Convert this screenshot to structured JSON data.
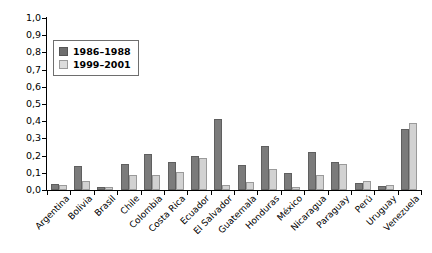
{
  "chart_data": {
    "type": "bar",
    "title": "",
    "xlabel": "",
    "ylabel": "",
    "ylim": [
      0,
      1.0
    ],
    "grid": false,
    "legend_position": "top-left",
    "ytick_labels": [
      "1,0",
      "0,9",
      "0,8",
      "0,7",
      "0,6",
      "0,5",
      "0,4",
      "0,3",
      "0,2",
      "0,1",
      "0,0"
    ],
    "ytick_values": [
      1.0,
      0.9,
      0.8,
      0.7,
      0.6,
      0.5,
      0.4,
      0.3,
      0.2,
      0.1,
      0.0
    ],
    "categories": [
      "Argentina",
      "Bolivia",
      "Brasil",
      "Chile",
      "Colombia",
      "Costa Rica",
      "Ecuador",
      "El Salvador",
      "Guatemala",
      "Honduras",
      "México",
      "Nicaragua",
      "Paraguay",
      "Perú",
      "Uruguay",
      "Venezuela"
    ],
    "series": [
      {
        "name": "1986–1988",
        "color": "#7b7b7b",
        "values": [
          0.035,
          0.14,
          0.015,
          0.15,
          0.208,
          0.16,
          0.195,
          0.41,
          0.145,
          0.255,
          0.1,
          0.222,
          0.16,
          0.04,
          0.025,
          0.355
        ]
      },
      {
        "name": "1999–2001",
        "color": "#d2d2d2",
        "values": [
          0.03,
          0.055,
          0.015,
          0.09,
          0.09,
          0.105,
          0.188,
          0.03,
          0.045,
          0.125,
          0.02,
          0.085,
          0.15,
          0.05,
          0.03,
          0.39
        ]
      }
    ]
  },
  "legend": {
    "entries": [
      {
        "label": "1986–1988"
      },
      {
        "label": "1999–2001"
      }
    ]
  }
}
